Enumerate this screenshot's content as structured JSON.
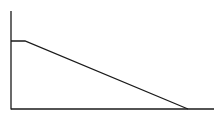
{
  "chart_data": {
    "type": "line",
    "title": "",
    "xlabel": "",
    "ylabel": "",
    "grid": false,
    "legend": null,
    "x": [
      0,
      0.07,
      0.87
    ],
    "values": [
      0.7,
      0.7,
      0
    ],
    "xlim": [
      0,
      1
    ],
    "ylim": [
      0,
      1
    ],
    "colors": {
      "line": "#1a1a1a",
      "axis": "#1a1a1a",
      "background": "#ffffff"
    }
  },
  "geometry": {
    "axis_origin": [
      11,
      109
    ],
    "y_axis_top": [
      11,
      11
    ],
    "x_axis_end": [
      214,
      109
    ],
    "points": "11,41 25,41 188,109"
  }
}
